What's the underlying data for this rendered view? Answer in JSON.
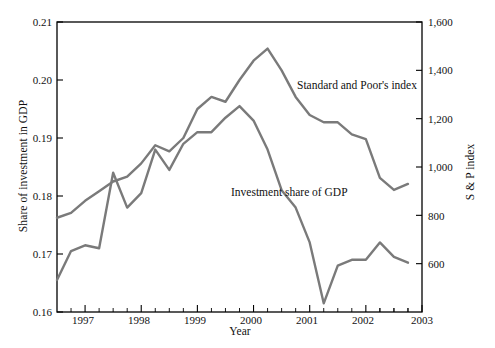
{
  "chart_data": {
    "type": "line",
    "title": "",
    "xlabel": "Year",
    "ylabel": "Share of investment in GDP",
    "y2label": "S & P index",
    "grid": false,
    "legend_position": "inline-annotations",
    "xlim": [
      1996.5,
      2003.0
    ],
    "ylim": [
      0.16,
      0.21
    ],
    "y2lim": [
      400,
      1600
    ],
    "x_ticks": [
      1997,
      1998,
      1999,
      2000,
      2001,
      2002,
      2003
    ],
    "x_tick_labels": [
      "1997",
      "1998",
      "1999",
      "2000",
      "2001",
      "2002",
      "2003"
    ],
    "x_minor_ticks_per_interval": 4,
    "y_ticks": [
      0.16,
      0.17,
      0.18,
      0.19,
      0.2,
      0.21
    ],
    "y_tick_labels": [
      "0.16",
      "0.17",
      "0.18",
      "0.19",
      "0.20",
      "0.21"
    ],
    "y2_ticks": [
      600,
      800,
      1000,
      1200,
      1400,
      1600
    ],
    "y2_tick_labels": [
      "600",
      "800",
      "1,000",
      "1,200",
      "1,400",
      "1,600"
    ],
    "series": [
      {
        "name": "Standard and Poor's index",
        "axis": "right",
        "color": "#7a7a7a",
        "annotation": "Standard and Poor's index",
        "x": [
          1996.5,
          1996.75,
          1997.0,
          1997.25,
          1997.5,
          1997.75,
          1998.0,
          1998.25,
          1998.5,
          1998.75,
          1999.0,
          1999.25,
          1999.5,
          1999.75,
          2000.0,
          2000.25,
          2000.5,
          2000.75,
          2001.0,
          2001.25,
          2001.5,
          2001.75,
          2002.0,
          2002.25,
          2002.5,
          2002.75
        ],
        "values": [
          790,
          810,
          860,
          900,
          940,
          960,
          1015,
          1090,
          1065,
          1120,
          1240,
          1290,
          1270,
          1360,
          1440,
          1490,
          1400,
          1290,
          1215,
          1185,
          1185,
          1135,
          1115,
          955,
          905,
          930
        ]
      },
      {
        "name": "Investment share of GDP",
        "axis": "left",
        "color": "#7a7a7a",
        "annotation": "Investment share of GDP",
        "x": [
          1996.5,
          1996.75,
          1997.0,
          1997.25,
          1997.5,
          1997.75,
          1998.0,
          1998.25,
          1998.5,
          1998.75,
          1999.0,
          1999.25,
          1999.5,
          1999.75,
          2000.0,
          2000.25,
          2000.5,
          2000.75,
          2001.0,
          2001.25,
          2001.5,
          2001.75,
          2002.0,
          2002.25,
          2002.5,
          2002.75
        ],
        "values": [
          0.1655,
          0.1705,
          0.1715,
          0.171,
          0.184,
          0.178,
          0.1805,
          0.188,
          0.1845,
          0.189,
          0.191,
          0.191,
          0.1935,
          0.1955,
          0.193,
          0.188,
          0.181,
          0.178,
          0.172,
          0.1615,
          0.168,
          0.169,
          0.169,
          0.172,
          0.1695,
          0.1685
        ]
      }
    ]
  },
  "annotations": {
    "sp_label": "Standard and Poor's index",
    "gdp_label": "Investment share of GDP"
  },
  "axes": {
    "x_title": "Year",
    "y_left_title": "Share of investment in GDP",
    "y_right_title": "S & P index"
  }
}
